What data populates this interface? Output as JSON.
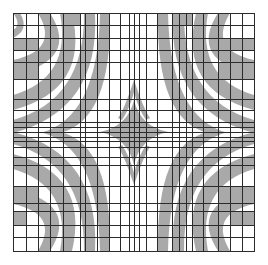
{
  "artwork": {
    "title": "",
    "kind": "op-art grid with curved gray bands",
    "canvas": {
      "width": 268,
      "height": 265
    },
    "frame": {
      "x0": 13,
      "y0": 13,
      "x1": 254,
      "y1": 251
    },
    "colors": {
      "background": "#ffffff",
      "band": "#a9a9a9",
      "grid_line": "#2b2b2b"
    },
    "vertical_lines_x": [
      13,
      26,
      38,
      50,
      63,
      80,
      85,
      97,
      109,
      120,
      129,
      134,
      139,
      146,
      157,
      172,
      179,
      186,
      192,
      203,
      218,
      230,
      242,
      254
    ],
    "horizontal_lines_y": [
      13,
      25,
      38,
      50,
      62,
      79,
      99,
      110,
      122,
      127,
      132,
      137,
      141,
      147,
      157,
      165,
      186,
      203,
      211,
      225,
      237,
      251
    ],
    "bands": [
      {
        "d": "M50,13 Q80,60 13,75 L13,60 Q60,50 38,13 Z"
      },
      {
        "d": "M72,13 Q90,90 13,110 L13,95 Q72,78 60,13 Z"
      },
      {
        "d": "M95,13 Q100,110 13,133 L13,120 Q85,100 84,13 Z"
      },
      {
        "d": "M20,13 Q30,30 13,38 L13,30 Q22,25 13,13 Z"
      },
      {
        "d": "M110,13 Q112,120 60,133 L40,133 Q98,118 100,13 Z"
      },
      {
        "d": "M218,13 Q188,60 254,75 L254,60 Q208,50 230,13 Z"
      },
      {
        "d": "M196,13 Q178,90 254,110 L254,95 Q196,78 208,13 Z"
      },
      {
        "d": "M173,13 Q168,110 254,133 L254,120 Q183,100 184,13 Z"
      },
      {
        "d": "M158,13 Q156,120 208,133 L228,133 Q170,118 168,13 Z"
      },
      {
        "d": "M50,251 Q80,204 13,189 L13,204 Q60,214 38,251 Z"
      },
      {
        "d": "M72,251 Q90,174 13,154 L13,169 Q72,186 60,251 Z"
      },
      {
        "d": "M95,251 Q100,154 13,132 L13,144 Q85,164 84,251 Z"
      },
      {
        "d": "M110,251 Q112,144 60,132 L40,132 Q98,146 100,251 Z"
      },
      {
        "d": "M218,251 Q188,204 254,189 L254,204 Q208,214 230,251 Z"
      },
      {
        "d": "M196,251 Q178,174 254,154 L254,169 Q196,186 208,251 Z"
      },
      {
        "d": "M173,251 Q168,154 254,132 L254,144 Q183,164 184,251 Z"
      },
      {
        "d": "M158,251 Q156,144 208,132 L228,132 Q170,146 168,251 Z"
      },
      {
        "d": "M134,100 Q128,126 100,132 Q128,138 134,165 Q140,138 168,132 Q140,126 134,100 Z"
      },
      {
        "d": "M134,80 Q124,110 118,118 L122,120 Q130,108 134,92 Q138,108 146,120 L150,118 Q144,110 134,80 Z"
      },
      {
        "d": "M134,185 Q124,155 118,147 L122,145 Q130,157 134,173 Q138,157 146,145 L150,147 Q144,155 134,185 Z"
      }
    ],
    "cell_fills": [
      {
        "x": 13,
        "y": 38,
        "w": 25,
        "h": 12
      },
      {
        "x": 13,
        "y": 62,
        "w": 25,
        "h": 17
      },
      {
        "x": 63,
        "y": 13,
        "w": 17,
        "h": 12
      },
      {
        "x": 13,
        "y": 186,
        "w": 25,
        "h": 17
      },
      {
        "x": 13,
        "y": 211,
        "w": 13,
        "h": 14
      },
      {
        "x": 218,
        "y": 38,
        "w": 36,
        "h": 12
      },
      {
        "x": 218,
        "y": 62,
        "w": 36,
        "h": 17
      },
      {
        "x": 218,
        "y": 186,
        "w": 36,
        "h": 17
      },
      {
        "x": 230,
        "y": 211,
        "w": 24,
        "h": 14
      },
      {
        "x": 172,
        "y": 13,
        "w": 20,
        "h": 12
      }
    ]
  }
}
